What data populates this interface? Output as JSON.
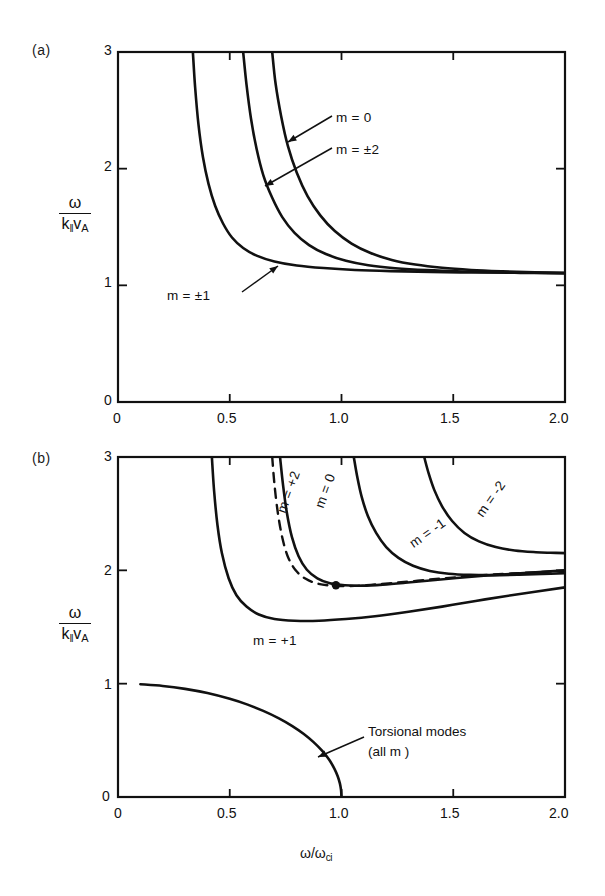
{
  "figure": {
    "background": "#ffffff",
    "ink": "#111111"
  },
  "panels": [
    {
      "id": "a",
      "tag": "(a)",
      "axis": {
        "ylabel_num": "ω",
        "ylabel_den_k": "k",
        "ylabel_den_par": "‖",
        "ylabel_den_v": "v",
        "ylabel_den_A": "A",
        "xlabel": "",
        "xticks": [
          "0",
          "0.5",
          "1.0",
          "1.5",
          "2.0"
        ],
        "xtick_values": [
          0,
          0.5,
          1.0,
          1.5,
          2.0
        ],
        "yticks": [
          "0",
          "1",
          "2",
          "3"
        ],
        "ytick_values": [
          0,
          1,
          2,
          3
        ],
        "xlim": [
          0,
          2.0
        ],
        "ylim": [
          0,
          3.0
        ],
        "grid": false
      },
      "labels": [
        {
          "name": "label-m-0",
          "text": "m = 0",
          "x": 336,
          "y": 118
        },
        {
          "name": "label-m-pm2",
          "text": "m = ±2",
          "x": 336,
          "y": 148
        },
        {
          "name": "label-m-pm1",
          "text": "m = ±1",
          "x": 170,
          "y": 292
        }
      ]
    },
    {
      "id": "b",
      "tag": "(b)",
      "axis": {
        "ylabel_num": "ω",
        "ylabel_den_k": "k",
        "ylabel_den_par": "‖",
        "ylabel_den_v": "v",
        "ylabel_den_A": "A",
        "xlabel_num": "ω",
        "xlabel_den": "ω",
        "xlabel_sub": "ci",
        "xlabel": "ω/ωci",
        "xticks": [
          "0",
          "0.5",
          "1.0",
          "1.5",
          "2.0"
        ],
        "xtick_values": [
          0,
          0.5,
          1.0,
          1.5,
          2.0
        ],
        "yticks": [
          "0",
          "1",
          "2",
          "3"
        ],
        "ytick_values": [
          0,
          1,
          2,
          3
        ],
        "xlim": [
          0,
          2.0
        ],
        "ylim": [
          0,
          3.0
        ],
        "grid": false
      },
      "labels": [
        {
          "name": "label-m-plus2",
          "text": "m = +2",
          "x": 281,
          "y": 505,
          "rotate": -70
        },
        {
          "name": "label-m-0",
          "text": "m = 0",
          "x": 319,
          "y": 500,
          "rotate": -70
        },
        {
          "name": "label-m-minus1",
          "text": "m = -1",
          "x": 416,
          "y": 535,
          "rotate": -35
        },
        {
          "name": "label-m-minus2",
          "text": "m = -2",
          "x": 480,
          "y": 507,
          "rotate": -55
        },
        {
          "name": "label-m-plus1",
          "text": "m = +1",
          "x": 253,
          "y": 640,
          "rotate": 0
        }
      ],
      "annotations": [
        {
          "name": "torsional-modes-annotation",
          "line1": "Torsional  modes",
          "line2": "(all  m )",
          "x": 368,
          "y": 727
        }
      ]
    }
  ],
  "chart_data": [
    {
      "type": "line",
      "panel": "a",
      "title": "(a)",
      "xlabel": "ω/ωci",
      "ylabel": "ω/(k‖ v_A)",
      "xlim": [
        0,
        2.0
      ],
      "ylim": [
        0,
        3.0
      ],
      "xticks": [
        0,
        0.5,
        1.0,
        1.5,
        2.0
      ],
      "yticks": [
        0,
        1,
        2,
        3
      ],
      "grid": false,
      "legend_position": "inline-annotations",
      "series": [
        {
          "name": "m = ±1",
          "style": "solid",
          "x": [
            0.335,
            0.345,
            0.36,
            0.38,
            0.405,
            0.435,
            0.47,
            0.51,
            0.56,
            0.62,
            0.7,
            0.8,
            0.92,
            1.06,
            1.22,
            1.4,
            1.6,
            1.8,
            2.0
          ],
          "y": [
            3.0,
            2.7,
            2.38,
            2.1,
            1.87,
            1.68,
            1.53,
            1.41,
            1.32,
            1.255,
            1.205,
            1.17,
            1.148,
            1.132,
            1.122,
            1.115,
            1.11,
            1.107,
            1.105
          ]
        },
        {
          "name": "m = ±2",
          "style": "solid",
          "x": [
            0.56,
            0.575,
            0.595,
            0.62,
            0.65,
            0.69,
            0.735,
            0.79,
            0.855,
            0.93,
            1.02,
            1.12,
            1.24,
            1.38,
            1.54,
            1.72,
            1.86,
            2.0
          ],
          "y": [
            3.0,
            2.72,
            2.43,
            2.17,
            1.945,
            1.75,
            1.585,
            1.45,
            1.345,
            1.268,
            1.21,
            1.172,
            1.147,
            1.13,
            1.119,
            1.112,
            1.108,
            1.105
          ]
        },
        {
          "name": "m = 0",
          "style": "solid",
          "x": [
            0.69,
            0.705,
            0.73,
            0.76,
            0.8,
            0.848,
            0.905,
            0.97,
            1.045,
            1.13,
            1.225,
            1.33,
            1.45,
            1.58,
            1.72,
            1.865,
            2.0
          ],
          "y": [
            3.0,
            2.73,
            2.45,
            2.195,
            1.965,
            1.765,
            1.6,
            1.465,
            1.358,
            1.277,
            1.218,
            1.178,
            1.15,
            1.132,
            1.12,
            1.111,
            1.106
          ]
        }
      ]
    },
    {
      "type": "line",
      "panel": "b",
      "title": "(b)",
      "xlabel": "ω/ωci",
      "ylabel": "ω/(k‖ v_A)",
      "xlim": [
        0,
        2.0
      ],
      "ylim": [
        0,
        3.0
      ],
      "xticks": [
        0,
        0.5,
        1.0,
        1.5,
        2.0
      ],
      "yticks": [
        0,
        1,
        2,
        3
      ],
      "grid": false,
      "legend_position": "inline-annotations",
      "series": [
        {
          "name": "m = +1",
          "style": "solid",
          "x": [
            0.42,
            0.43,
            0.445,
            0.465,
            0.495,
            0.53,
            0.575,
            0.63,
            0.7,
            0.79,
            0.9,
            1.02,
            1.15,
            1.3,
            1.45,
            1.6,
            1.76,
            2.0
          ],
          "y": [
            3.0,
            2.7,
            2.4,
            2.15,
            1.93,
            1.78,
            1.68,
            1.61,
            1.57,
            1.555,
            1.555,
            1.57,
            1.595,
            1.635,
            1.68,
            1.73,
            1.78,
            1.85
          ]
        },
        {
          "name": "m = +2",
          "style": "dashed",
          "x": [
            0.69,
            0.7,
            0.715,
            0.735,
            0.76,
            0.795,
            0.84,
            0.895,
            0.96,
            1.04,
            1.13,
            1.23,
            1.34,
            1.46,
            1.6,
            1.76,
            2.0
          ],
          "y": [
            3.0,
            2.76,
            2.51,
            2.29,
            2.12,
            2.0,
            1.925,
            1.882,
            1.865,
            1.862,
            1.872,
            1.888,
            1.908,
            1.93,
            1.952,
            1.972,
            1.995
          ]
        },
        {
          "name": "m = 0",
          "style": "solid",
          "x": [
            0.725,
            0.738,
            0.755,
            0.778,
            0.808,
            0.845,
            0.892,
            0.948,
            1.015,
            1.095,
            1.185,
            1.285,
            1.395,
            1.515,
            1.65,
            1.8,
            2.0
          ],
          "y": [
            3.0,
            2.76,
            2.515,
            2.295,
            2.125,
            2.005,
            1.93,
            1.886,
            1.868,
            1.865,
            1.874,
            1.89,
            1.91,
            1.932,
            1.954,
            1.974,
            2.0
          ]
        },
        {
          "name": "m = -1",
          "style": "solid",
          "x": [
            1.055,
            1.07,
            1.09,
            1.118,
            1.155,
            1.2,
            1.255,
            1.32,
            1.395,
            1.48,
            1.575,
            1.68,
            1.795,
            1.9,
            2.0
          ],
          "y": [
            3.0,
            2.83,
            2.65,
            2.48,
            2.33,
            2.205,
            2.11,
            2.04,
            1.995,
            1.97,
            1.96,
            1.958,
            1.962,
            1.968,
            1.975
          ]
        },
        {
          "name": "m = -2",
          "style": "solid",
          "x": [
            1.37,
            1.39,
            1.415,
            1.45,
            1.495,
            1.55,
            1.615,
            1.69,
            1.775,
            1.87,
            1.935,
            2.0
          ],
          "y": [
            3.0,
            2.855,
            2.71,
            2.565,
            2.435,
            2.33,
            2.255,
            2.205,
            2.175,
            2.16,
            2.155,
            2.152
          ]
        },
        {
          "name": "Torsional modes (all m)",
          "style": "solid",
          "x": [
            0.1,
            0.2,
            0.3,
            0.4,
            0.5,
            0.58,
            0.65,
            0.72,
            0.78,
            0.83,
            0.875,
            0.915,
            0.945,
            0.968,
            0.983,
            0.993,
            0.998,
            1.0
          ],
          "y": [
            0.995,
            0.98,
            0.954,
            0.917,
            0.866,
            0.815,
            0.76,
            0.694,
            0.626,
            0.558,
            0.484,
            0.404,
            0.328,
            0.251,
            0.183,
            0.118,
            0.06,
            0.0
          ]
        }
      ],
      "markers": [
        {
          "name": "tangency-dot",
          "x": 0.975,
          "y": 1.868
        }
      ]
    }
  ]
}
